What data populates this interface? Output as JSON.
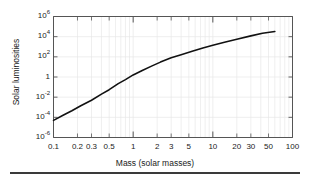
{
  "figure": {
    "background_color": "#ffffff",
    "frame_color": "#555555",
    "grid_color": "#e8e8e8",
    "curve_color": "#111111",
    "bottom_rule": true
  },
  "chart_data": {
    "type": "line",
    "title": "",
    "xlabel": "Mass (solar masses)",
    "ylabel": "Solar luminosities",
    "xscale": "log",
    "yscale": "log",
    "xlim": [
      0.1,
      100
    ],
    "ylim": [
      1e-06,
      1000000.0
    ],
    "grid": true,
    "legend": null,
    "xtick_labels": [
      "0.1",
      "0.2",
      "0.3",
      "0.5",
      "1",
      "2",
      "3",
      "5",
      "10",
      "20",
      "30",
      "50",
      "100"
    ],
    "xtick_values": [
      0.1,
      0.2,
      0.3,
      0.5,
      1,
      2,
      3,
      5,
      10,
      20,
      30,
      50,
      100
    ],
    "ytick_labels": [
      "10⁶",
      "10⁴",
      "10²",
      "1",
      "10⁻²",
      "10⁻⁴",
      "10⁻⁶"
    ],
    "ytick_values": [
      1000000.0,
      10000.0,
      100.0,
      1,
      0.01,
      0.0001,
      1e-06
    ],
    "series": [
      {
        "name": "mass-luminosity relation",
        "x": [
          0.1,
          0.13,
          0.17,
          0.22,
          0.3,
          0.4,
          0.5,
          0.65,
          0.8,
          1.0,
          1.3,
          1.7,
          2.2,
          3.0,
          4.0,
          5.5,
          7.5,
          10,
          14,
          20,
          30,
          42,
          60
        ],
        "y": [
          5e-05,
          0.00015,
          0.00045,
          0.0014,
          0.005,
          0.02,
          0.055,
          0.22,
          0.55,
          1.6,
          4.5,
          12,
          30,
          80,
          160,
          350,
          750,
          1400,
          2800,
          5500,
          12000,
          22000,
          32000
        ]
      }
    ]
  },
  "ticks": {
    "y": [
      {
        "label_html": "10<sup>6</sup>",
        "value": 1000000.0
      },
      {
        "label_html": "10<sup>4</sup>",
        "value": 10000.0
      },
      {
        "label_html": "10<sup>2</sup>",
        "value": 100.0
      },
      {
        "label_html": "1",
        "value": 1
      },
      {
        "label_html": "10<sup>-2</sup>",
        "value": 0.01
      },
      {
        "label_html": "10<sup>-4</sup>",
        "value": 0.0001
      },
      {
        "label_html": "10<sup>-6</sup>",
        "value": 1e-06
      }
    ],
    "x": [
      {
        "label": "0.1",
        "value": 0.1
      },
      {
        "label": "0.2",
        "value": 0.2
      },
      {
        "label": "0.3",
        "value": 0.3
      },
      {
        "label": "0.5",
        "value": 0.5
      },
      {
        "label": "1",
        "value": 1
      },
      {
        "label": "2",
        "value": 2
      },
      {
        "label": "3",
        "value": 3
      },
      {
        "label": "5",
        "value": 5
      },
      {
        "label": "10",
        "value": 10
      },
      {
        "label": "20",
        "value": 20
      },
      {
        "label": "30",
        "value": 30
      },
      {
        "label": "50",
        "value": 50
      },
      {
        "label": "100",
        "value": 100
      }
    ]
  },
  "axis_titles": {
    "x": "Mass (solar masses)",
    "y": "Solar luminosities"
  }
}
